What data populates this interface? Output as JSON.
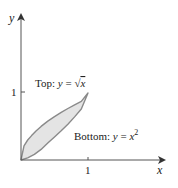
{
  "diagram": {
    "axes": {
      "x_label": "x",
      "y_label": "y",
      "x_tick": "1",
      "y_tick": "1"
    },
    "labels": {
      "top_prefix": "Top: ",
      "top_y": "y",
      "top_eq": " = ",
      "top_sqrt": "√",
      "top_x": "x",
      "bottom_prefix": "Bottom: ",
      "bottom_y": "y",
      "bottom_eq": " = ",
      "bottom_x": "x",
      "bottom_exp": "2"
    },
    "colors": {
      "fill": "#e4e4e4",
      "curve": "#8a8a8a",
      "axis": "#555555"
    }
  }
}
